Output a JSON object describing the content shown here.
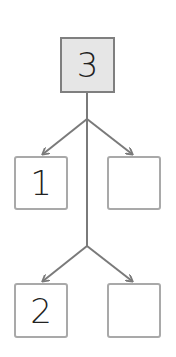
{
  "diagram": {
    "type": "number-bond-tree",
    "root": {
      "value": "3",
      "fill": "#e6e6e6"
    },
    "level1": [
      {
        "value": "1"
      },
      {
        "value": ""
      }
    ],
    "level2": [
      {
        "value": "2"
      },
      {
        "value": ""
      }
    ],
    "colors": {
      "line": "#7a7a7a",
      "box_border": "#a9a9a9",
      "root_border": "#7f7f7f",
      "text": "#222222"
    }
  }
}
